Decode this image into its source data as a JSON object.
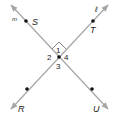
{
  "diagram": {
    "lines": [
      {
        "name": "m",
        "label": "m"
      },
      {
        "name": "l",
        "label": "ℓ"
      }
    ],
    "points": [
      {
        "name": "S",
        "label": "S"
      },
      {
        "name": "T",
        "label": "T"
      },
      {
        "name": "R",
        "label": "R"
      },
      {
        "name": "U",
        "label": "U"
      }
    ],
    "angles": [
      {
        "name": "angle-1",
        "label": "1"
      },
      {
        "name": "angle-2",
        "label": "2"
      },
      {
        "name": "angle-3",
        "label": "3"
      },
      {
        "name": "angle-4",
        "label": "4"
      }
    ],
    "right_angle_marker": "angle 1 is a right angle",
    "colors": {
      "line": "#a6a6a6",
      "point": "#111111",
      "text": "#222222"
    }
  }
}
